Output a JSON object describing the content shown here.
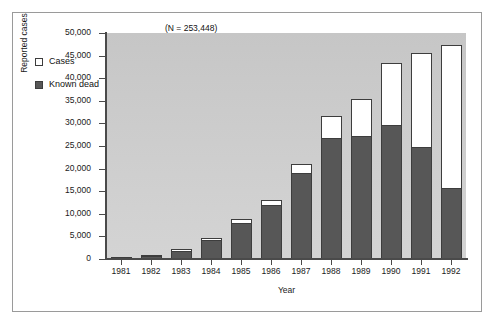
{
  "figure": {
    "annotation": "(N = 253,448)",
    "colors": {
      "plot_background": "#cccccc",
      "cases_fill": "#ffffff",
      "known_dead_fill": "#575757",
      "axis": "#4a4a4a",
      "frame": "#9a9a9a"
    }
  },
  "legend": {
    "position": "upper-left-inside",
    "items": [
      {
        "label": "Cases",
        "swatch": "cases"
      },
      {
        "label": "Known dead",
        "swatch": "dead"
      }
    ]
  },
  "chart_data": {
    "type": "bar",
    "subtype": "stacked-vertical",
    "title": "",
    "subtitle": "",
    "annotation": "(N = 253,448)",
    "xlabel": "Year",
    "ylabel": "Reported cases",
    "ylim": [
      0,
      50000
    ],
    "ytick_step": 5000,
    "grid": false,
    "legend_position": "upper left (inside plot)",
    "categories": [
      "1981",
      "1982",
      "1983",
      "1984",
      "1985",
      "1986",
      "1987",
      "1988",
      "1989",
      "1990",
      "1991",
      "1992"
    ],
    "ytick_labels": [
      "0",
      "5,000",
      "10,000",
      "15,000",
      "20,000",
      "25,000",
      "30,000",
      "35,000",
      "40,000",
      "45,000",
      "50,000"
    ],
    "ytick_values": [
      0,
      5000,
      10000,
      15000,
      20000,
      25000,
      30000,
      35000,
      40000,
      45000,
      50000
    ],
    "series": [
      {
        "name": "Cases",
        "note": "total bar height (cases); white segment is cases minus known dead",
        "values": [
          400,
          800,
          2200,
          4700,
          8800,
          13000,
          21000,
          31700,
          35300,
          43400,
          45500,
          47300
        ]
      },
      {
        "name": "Known dead",
        "note": "dark segment, measured from zero",
        "values": [
          300,
          600,
          1800,
          4100,
          8000,
          12000,
          19000,
          26800,
          27200,
          29700,
          24800,
          15700
        ]
      }
    ]
  }
}
